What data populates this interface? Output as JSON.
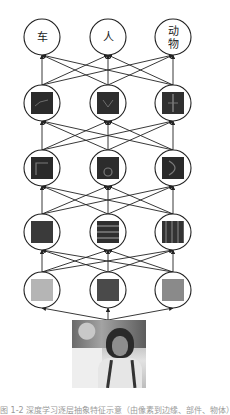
{
  "figure": {
    "type": "layered-neural-network-feature-hierarchy",
    "columns_x": [
      42,
      108,
      173
    ],
    "rows_y": [
      37,
      103,
      168,
      232,
      290
    ],
    "node_radius": 18,
    "output_labels": [
      "车",
      "人",
      "动物"
    ],
    "output_labels_lines": [
      [
        "车"
      ],
      [
        "人"
      ],
      [
        "动",
        "物"
      ]
    ],
    "layers": [
      {
        "name": "output",
        "nodes": [
          {
            "kind": "label",
            "text": "车"
          },
          {
            "kind": "label",
            "text": "人"
          },
          {
            "kind": "label",
            "text": "动物"
          }
        ]
      },
      {
        "name": "hidden-3",
        "nodes": [
          {
            "kind": "feature",
            "fill": "#2b2b2b",
            "pattern": "object-part-1"
          },
          {
            "kind": "feature",
            "fill": "#2e2e2e",
            "pattern": "object-part-2"
          },
          {
            "kind": "feature",
            "fill": "#303030",
            "pattern": "object-part-3"
          }
        ]
      },
      {
        "name": "hidden-2",
        "nodes": [
          {
            "kind": "feature",
            "fill": "#2a2a2a",
            "pattern": "corner"
          },
          {
            "kind": "feature",
            "fill": "#2c2c2c",
            "pattern": "circle"
          },
          {
            "kind": "feature",
            "fill": "#2a2a2a",
            "pattern": "curve"
          }
        ]
      },
      {
        "name": "hidden-1",
        "nodes": [
          {
            "kind": "feature",
            "fill": "#3a3a3a",
            "pattern": "plain"
          },
          {
            "kind": "feature",
            "fill": "#333333",
            "pattern": "horizontal-stripes"
          },
          {
            "kind": "feature",
            "fill": "#383838",
            "pattern": "vertical-stripes"
          }
        ]
      },
      {
        "name": "pixels",
        "nodes": [
          {
            "kind": "feature",
            "fill": "#b5b5b5",
            "pattern": "plain"
          },
          {
            "kind": "feature",
            "fill": "#4a4a4a",
            "pattern": "plain"
          },
          {
            "kind": "feature",
            "fill": "#8a8a8a",
            "pattern": "plain"
          }
        ]
      }
    ],
    "input": {
      "kind": "photo",
      "description": "person with curly hair outdoors"
    }
  },
  "caption": "图 1-2  深度学习逐层抽象特征示意（由像素到边缘、部件、物体）"
}
